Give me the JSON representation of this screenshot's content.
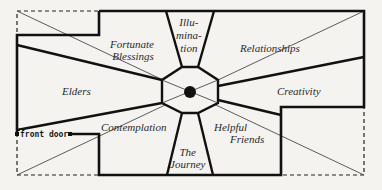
{
  "diagram": {
    "type": "bagua-floor-plan",
    "areas": [
      {
        "id": "fortunate-blessings",
        "label": "Fortunate Blessings",
        "lines": [
          "Fortunate",
          "Blessings"
        ]
      },
      {
        "id": "illumination",
        "label": "Illumination",
        "lines": [
          "Illu-",
          "mina-",
          "tion"
        ]
      },
      {
        "id": "relationships",
        "label": "Relationships",
        "lines": [
          "Relationships"
        ]
      },
      {
        "id": "elders",
        "label": "Elders",
        "lines": [
          "Elders"
        ]
      },
      {
        "id": "creativity",
        "label": "Creativity",
        "lines": [
          "Creativity"
        ]
      },
      {
        "id": "contemplation",
        "label": "Contemplation",
        "lines": [
          "Contemplation"
        ]
      },
      {
        "id": "the-journey",
        "label": "The Journey",
        "lines": [
          "The",
          "Journey"
        ]
      },
      {
        "id": "helpful-friends",
        "label": "Helpful Friends",
        "lines": [
          "Helpful",
          "Friends"
        ]
      }
    ],
    "front_door_label": "front door",
    "center": "octagon with central dot",
    "colors": {
      "line": "#111111",
      "background": "#f4f3f0",
      "text": "#2a2a2a"
    }
  }
}
